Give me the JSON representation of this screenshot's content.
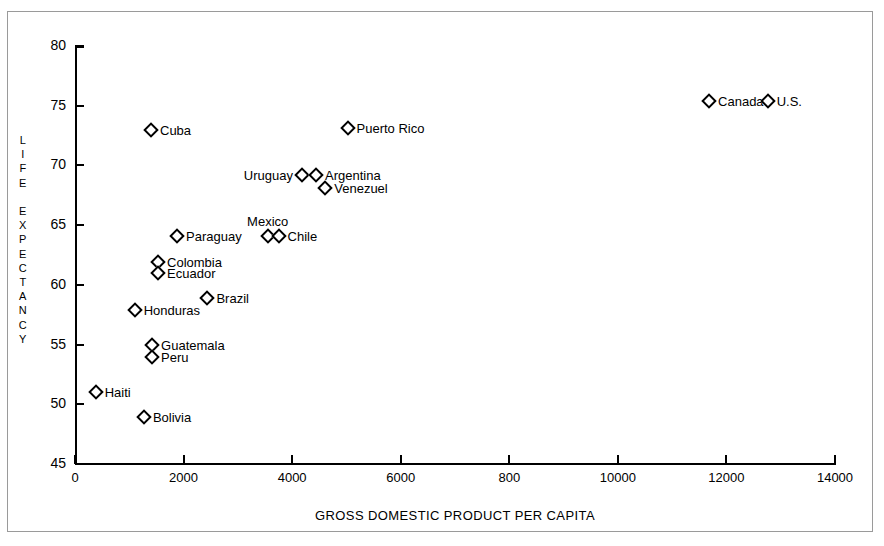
{
  "chart_data": {
    "type": "scatter",
    "title": "",
    "xlabel": "GROSS DOMESTIC PRODUCT PER CAPITA",
    "ylabel": "LIFE EXPECTANCY",
    "ylabel_letters": [
      "L",
      "I",
      "F",
      "E",
      "",
      "E",
      "X",
      "P",
      "E",
      "C",
      "T",
      "A",
      "N",
      "C",
      "Y"
    ],
    "xlim": [
      0,
      14000
    ],
    "ylim": [
      45,
      80
    ],
    "grid": false,
    "legend": "none",
    "xticks": [
      "0",
      "2000",
      "4000",
      "6000",
      "800",
      "10000",
      "12000",
      "14000"
    ],
    "xtick_values": [
      0,
      2000,
      4000,
      6000,
      8000,
      10000,
      12000,
      14000
    ],
    "yticks": [
      "45",
      "50",
      "55",
      "60",
      "65",
      "70",
      "75",
      "80"
    ],
    "ytick_values": [
      45,
      50,
      55,
      60,
      65,
      70,
      75,
      80
    ],
    "points": [
      {
        "label": "Haiti",
        "x": 380,
        "y": 51.0,
        "label_pos": "right"
      },
      {
        "label": "Bolivia",
        "x": 1270,
        "y": 48.9,
        "label_pos": "right"
      },
      {
        "label": "Honduras",
        "x": 1100,
        "y": 57.9,
        "label_pos": "right"
      },
      {
        "label": "Guatemala",
        "x": 1420,
        "y": 55.0,
        "label_pos": "right"
      },
      {
        "label": "Peru",
        "x": 1420,
        "y": 54.0,
        "label_pos": "right"
      },
      {
        "label": "Cuba",
        "x": 1400,
        "y": 73.0,
        "label_pos": "right"
      },
      {
        "label": "Colombia",
        "x": 1530,
        "y": 61.9,
        "label_pos": "right"
      },
      {
        "label": "Ecuador",
        "x": 1530,
        "y": 61.0,
        "label_pos": "right"
      },
      {
        "label": "Paraguay",
        "x": 1880,
        "y": 64.1,
        "label_pos": "right"
      },
      {
        "label": "Brazil",
        "x": 2440,
        "y": 58.9,
        "label_pos": "right"
      },
      {
        "label": "Mexico",
        "x": 3550,
        "y": 64.1,
        "label_pos": "above"
      },
      {
        "label": "Chile",
        "x": 3750,
        "y": 64.1,
        "label_pos": "right"
      },
      {
        "label": "Uruguay",
        "x": 4180,
        "y": 69.2,
        "label_pos": "left"
      },
      {
        "label": "Argentina",
        "x": 4440,
        "y": 69.2,
        "label_pos": "right"
      },
      {
        "label": "Venezuel",
        "x": 4610,
        "y": 68.1,
        "label_pos": "right"
      },
      {
        "label": "Puerto Rico",
        "x": 5020,
        "y": 73.1,
        "label_pos": "right"
      },
      {
        "label": "Canada",
        "x": 11680,
        "y": 75.4,
        "label_pos": "right"
      },
      {
        "label": "U.S.",
        "x": 12760,
        "y": 75.4,
        "label_pos": "right"
      }
    ]
  }
}
